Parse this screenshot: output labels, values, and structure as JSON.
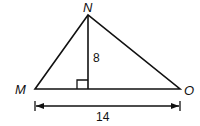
{
  "diagram": {
    "type": "triangle",
    "vertices": {
      "N": {
        "label": "N"
      },
      "M": {
        "label": "M"
      },
      "O": {
        "label": "O"
      }
    },
    "altitude_label": "8",
    "base_label": "14",
    "right_angle_marker": true
  }
}
